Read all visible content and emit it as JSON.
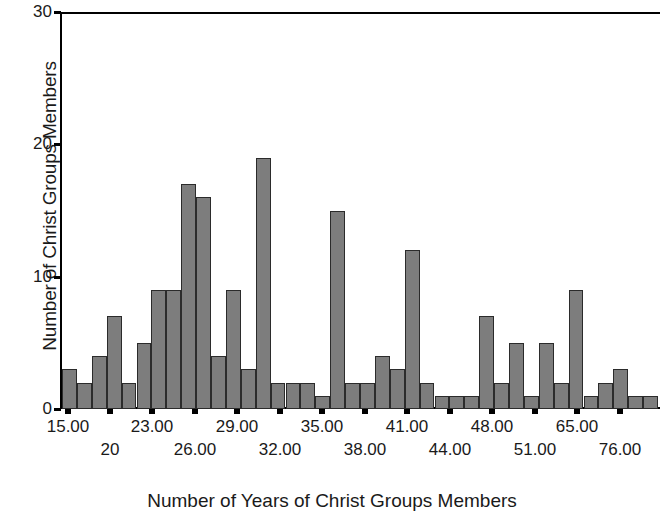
{
  "chart_data": {
    "type": "bar",
    "title": "",
    "subtitle": "",
    "xlabel": "Number of Years of Christ Groups Members",
    "ylabel": "Number of Christ Groups Members",
    "ylim": [
      0,
      30
    ],
    "y_ticks": [
      0,
      10,
      20,
      30
    ],
    "y_tick_labels": [
      "0",
      "10",
      "20",
      "30"
    ],
    "grid": false,
    "legend": null,
    "bar_color": "#7d7d7d",
    "bar_border_color": "#2b2b2b",
    "axis_color": "#000000",
    "background": "#ffffff",
    "n_bins": 40,
    "x_tick_labels": [
      "15.00",
      "20",
      "23.00",
      "26.00",
      "29.00",
      "32.00",
      "35.00",
      "38.00",
      "41.00",
      "44.00",
      "48.00",
      "51.00",
      "65.00",
      "76.00"
    ],
    "x_tick_positions_px": [
      68,
      110,
      152,
      195,
      237,
      280,
      322,
      365,
      407,
      450,
      492,
      535,
      577,
      620
    ],
    "x_tick_rows": [
      0,
      1,
      0,
      1,
      0,
      1,
      0,
      1,
      0,
      1,
      0,
      1,
      0,
      1
    ],
    "categories": [
      "15.00",
      "16.00",
      "17.00",
      "18.00",
      "19.00",
      "20.00",
      "21.00",
      "22.00",
      "23.00",
      "24.00",
      "25.00",
      "26.00",
      "27.00",
      "28.00",
      "29.00",
      "30.00",
      "31.00",
      "32.00",
      "33.00",
      "34.00",
      "35.00",
      "36.00",
      "37.00",
      "38.00",
      "39.00",
      "40.00",
      "41.00",
      "42.00",
      "43.00",
      "44.00",
      "45.00",
      "46.00",
      "48.00",
      "50.00",
      "51.00",
      "55.00",
      "60.00",
      "65.00",
      "70.00",
      "76.00"
    ],
    "values": [
      3,
      2,
      4,
      7,
      2,
      5,
      9,
      9,
      17,
      16,
      4,
      9,
      3,
      19,
      2,
      2,
      2,
      1,
      15,
      2,
      2,
      4,
      3,
      12,
      2,
      1,
      1,
      1,
      7,
      2,
      5,
      1,
      5,
      2,
      9,
      1,
      2,
      3,
      1,
      1
    ]
  },
  "axes": {
    "y_title": "Number of Christ Groups Members",
    "x_title": "Number of Years of Christ Groups Members"
  }
}
